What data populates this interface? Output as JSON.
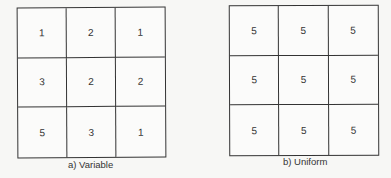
{
  "figure": {
    "panels": [
      {
        "id": "a",
        "caption": "a) Variable",
        "rows": [
          [
            "1",
            "2",
            "1"
          ],
          [
            "3",
            "2",
            "2"
          ],
          [
            "5",
            "3",
            "1"
          ]
        ]
      },
      {
        "id": "b",
        "caption": "b) Uniform",
        "rows": [
          [
            "5",
            "5",
            "5"
          ],
          [
            "5",
            "5",
            "5"
          ],
          [
            "5",
            "5",
            "5"
          ]
        ]
      }
    ]
  }
}
